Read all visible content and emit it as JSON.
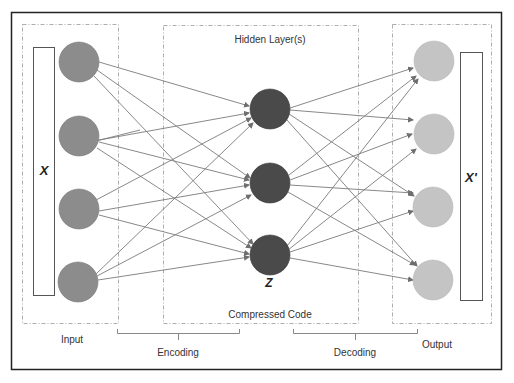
{
  "diagram": {
    "labels": {
      "hidden_layers": "Hidden Layer(s)",
      "compressed_code": "Compressed Code",
      "input": "Input",
      "output": "Output",
      "encoding": "Encoding",
      "decoding": "Decoding",
      "input_vector": "X",
      "output_vector": "X'",
      "code": "Z"
    },
    "colors": {
      "input_node": "#8c8c8c",
      "hidden_node": "#4a4a4a",
      "output_node": "#c4c4c4",
      "edge": "#7a7a7a",
      "frame": "#222222"
    },
    "nodes": {
      "input": 4,
      "hidden": 3,
      "output": 4
    },
    "edges": {
      "encoding": "fully connected input -> hidden (12)",
      "decoding": "fully connected hidden -> output (12)"
    }
  }
}
